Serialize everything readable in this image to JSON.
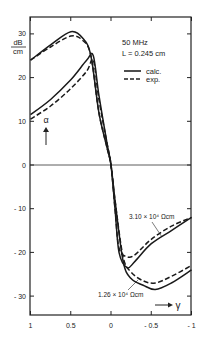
{
  "chart_data": {
    "type": "line",
    "title": "",
    "xlabel": "γ",
    "ylabel": "α",
    "yunit_num": "dB",
    "yunit_den": "cm",
    "xlim": [
      1,
      -1
    ],
    "ylim": [
      -34,
      34
    ],
    "x_ticks": [
      "1",
      "0.5",
      "0",
      "-0.5",
      "-1"
    ],
    "y_ticks": [
      "30",
      "20",
      "10",
      "0",
      "-10",
      "-20",
      "-30"
    ],
    "annotations": {
      "freq": "50 MHz",
      "length": "L = 0.245 cm",
      "res1": "3.10 × 10⁴ Ωcm",
      "res2": "1.26 × 10⁴ Ωcm"
    },
    "legend": [
      {
        "label": "calc.",
        "style": "solid"
      },
      {
        "label": "exp.",
        "style": "dashed"
      }
    ],
    "series": [
      {
        "name": "1.26e4 Ωcm calc.",
        "style": "solid",
        "x": [
          1,
          0.75,
          0.5,
          0.35,
          0.25,
          0.15,
          0.05,
          0,
          -0.05,
          -0.15,
          -0.25,
          -0.4,
          -0.55,
          -0.75,
          -1
        ],
        "y": [
          24,
          27.5,
          30.5,
          29,
          25,
          12,
          4,
          0,
          -8,
          -22,
          -26,
          -27.5,
          -28.5,
          -27,
          -24
        ]
      },
      {
        "name": "1.26e4 Ωcm exp.",
        "style": "dashed",
        "x": [
          1,
          0.75,
          0.5,
          0.35,
          0.25,
          0.15,
          0.05,
          0,
          -0.05,
          -0.15,
          -0.25,
          -0.4,
          -0.55,
          -0.75,
          -1
        ],
        "y": [
          24,
          27,
          29.5,
          28.5,
          25,
          12,
          4,
          0,
          -8,
          -21,
          -24.5,
          -26.5,
          -27,
          -25.5,
          -23
        ]
      },
      {
        "name": "3.10e4 Ωcm calc.",
        "style": "solid",
        "x": [
          1,
          0.75,
          0.5,
          0.3,
          0.22,
          0.15,
          0.05,
          0,
          -0.05,
          -0.1,
          -0.2,
          -0.3,
          -0.5,
          -0.75,
          -1
        ],
        "y": [
          11.5,
          15,
          19.5,
          24,
          25,
          16,
          5,
          0,
          -10,
          -20,
          -23.5,
          -22,
          -18,
          -15,
          -12
        ]
      },
      {
        "name": "3.10e4 Ωcm exp.",
        "style": "dashed",
        "x": [
          1,
          0.75,
          0.5,
          0.3,
          0.22,
          0.15,
          0.05,
          0,
          -0.05,
          -0.1,
          -0.2,
          -0.3,
          -0.5,
          -0.75,
          -1
        ],
        "y": [
          10.5,
          13.5,
          17.5,
          21.5,
          24,
          15,
          5,
          0,
          -10,
          -19,
          -21,
          -20.5,
          -17,
          -14,
          -12
        ]
      }
    ]
  }
}
